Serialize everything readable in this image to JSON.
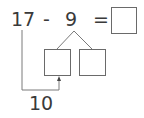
{
  "problem": {
    "minuend": "17",
    "minus": "-",
    "subtrahend": "9",
    "equals": "=",
    "answer": "",
    "split_left": "",
    "split_right": "",
    "intermediate": "10"
  },
  "colors": {
    "text": "#3a3a3a",
    "line": "#6a6a6a"
  }
}
